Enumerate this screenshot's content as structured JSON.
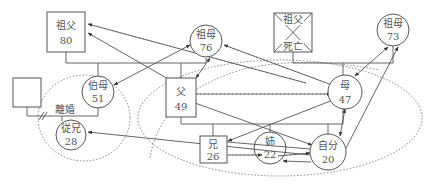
{
  "diagram": {
    "type": "ecomap-genogram",
    "nodes": {
      "grandfather_paternal": {
        "label": "祖父",
        "age": "80",
        "shape": "square"
      },
      "grandmother_paternal": {
        "label": "祖母",
        "age": "76",
        "shape": "circle"
      },
      "grandfather_maternal": {
        "label_top": "祖父",
        "label_bottom": "死亡",
        "shape": "square-deceased"
      },
      "grandmother_maternal": {
        "label": "祖母",
        "age": "73",
        "shape": "circle"
      },
      "aunt": {
        "label": "伯母",
        "age": "51",
        "shape": "circle"
      },
      "aunt_spouse": {
        "label": "",
        "shape": "square"
      },
      "cousin": {
        "label": "従兄",
        "age": "28",
        "shape": "circle"
      },
      "father": {
        "label": "父",
        "age": "49",
        "shape": "square"
      },
      "mother": {
        "label": "母",
        "age": "47",
        "shape": "circle"
      },
      "brother": {
        "label": "兄",
        "age": "26",
        "shape": "square"
      },
      "sister": {
        "label": "姉",
        "age": "22",
        "shape": "circle"
      },
      "self": {
        "label": "自分",
        "age": "20",
        "shape": "circle-double"
      }
    },
    "annotations": {
      "divorce": "離婚"
    },
    "legend_relations": [
      "solid-arrow: relationship direction",
      "hatched-line: conflict",
      "dotted-line: weak tie / household boundary"
    ]
  }
}
